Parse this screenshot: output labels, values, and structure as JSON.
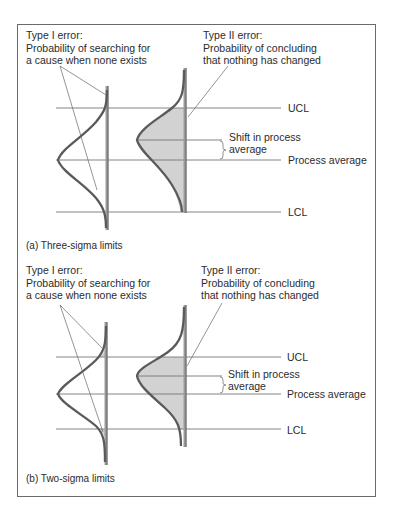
{
  "figure": {
    "panels": [
      {
        "id": "a",
        "caption": "(a)  Three-sigma limits",
        "type1": {
          "title": "Type I error:",
          "line1": "Probability of searching for",
          "line2": "a cause when none exists"
        },
        "type2": {
          "title": "Type II error:",
          "line1": "Probability of concluding",
          "line2": "that nothing has changed"
        },
        "labels": {
          "ucl": "UCL",
          "shift_line1": "Shift in process",
          "shift_line2": "average",
          "process_average": "Process average",
          "lcl": "LCL"
        }
      },
      {
        "id": "b",
        "caption": "(b)  Two-sigma limits",
        "type1": {
          "title": "Type I error:",
          "line1": "Probability of searching for",
          "line2": "a cause when none exists"
        },
        "type2": {
          "title": "Type II error:",
          "line1": "Probability of concluding",
          "line2": "that nothing has changed"
        },
        "labels": {
          "ucl": "UCL",
          "shift_line1": "Shift in process",
          "shift_line2": "average",
          "process_average": "Process average",
          "lcl": "LCL"
        }
      }
    ],
    "colors": {
      "curve": "#5a5a5a",
      "shade": "#d2d2d2",
      "line": "#777777",
      "frame": "#6a6a6a"
    }
  }
}
